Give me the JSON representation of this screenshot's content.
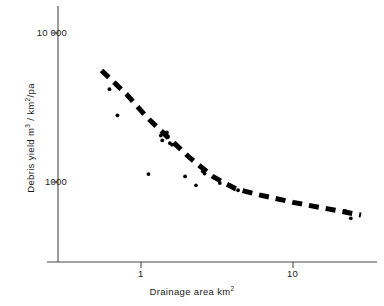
{
  "chart_data": {
    "type": "scatter",
    "title": "",
    "xlabel": "Drainage area  km2",
    "xlabel_main": "Drainage area  km",
    "xlabel_sup": "2",
    "ylabel": "Debris yield m3 / km2/pa",
    "ylabel_part1": "Debris yield  m",
    "ylabel_sup1": "3",
    "ylabel_part2": " / km",
    "ylabel_sup2": "2",
    "ylabel_part3": "/pa",
    "xscale": "log",
    "yscale": "log",
    "xlim": [
      0.35,
      35
    ],
    "ylim": [
      400,
      13000
    ],
    "xticks": [
      1,
      10
    ],
    "xtick_labels": [
      "1",
      "10"
    ],
    "yticks": [
      1000,
      10000
    ],
    "ytick_labels": [
      "1000",
      "10 000"
    ],
    "grid": false,
    "legend": "none",
    "marker_color": "#000000",
    "line_color": "#000000",
    "axis_color": "#444444",
    "background": "#ffffff",
    "points": [
      {
        "x": 0.62,
        "y": 4200
      },
      {
        "x": 0.68,
        "y": 4600
      },
      {
        "x": 0.69,
        "y": 4500
      },
      {
        "x": 0.7,
        "y": 2800
      },
      {
        "x": 1.12,
        "y": 1130
      },
      {
        "x": 1.35,
        "y": 2050
      },
      {
        "x": 1.38,
        "y": 1900
      },
      {
        "x": 1.48,
        "y": 2150
      },
      {
        "x": 1.5,
        "y": 2000
      },
      {
        "x": 1.55,
        "y": 1820
      },
      {
        "x": 1.6,
        "y": 1780
      },
      {
        "x": 1.95,
        "y": 1090
      },
      {
        "x": 2.3,
        "y": 950
      },
      {
        "x": 2.55,
        "y": 1180
      },
      {
        "x": 2.62,
        "y": 1140
      },
      {
        "x": 3.3,
        "y": 985
      },
      {
        "x": 4.35,
        "y": 880
      },
      {
        "x": 22.0,
        "y": 640
      },
      {
        "x": 24.0,
        "y": 570
      }
    ],
    "trend_line": {
      "style": "dashed",
      "width_px": 5,
      "dash_pattern": "10 7",
      "vertices": [
        {
          "x": 0.55,
          "y": 5600
        },
        {
          "x": 0.8,
          "y": 3900
        },
        {
          "x": 1.1,
          "y": 2700
        },
        {
          "x": 1.5,
          "y": 2000
        },
        {
          "x": 2.1,
          "y": 1450
        },
        {
          "x": 3.0,
          "y": 1080
        },
        {
          "x": 4.2,
          "y": 900
        },
        {
          "x": 6.0,
          "y": 820
        },
        {
          "x": 10.0,
          "y": 730
        },
        {
          "x": 17.0,
          "y": 660
        },
        {
          "x": 28.0,
          "y": 600
        }
      ]
    },
    "axes_geometry": {
      "origin_px": {
        "x": 58,
        "y": 262
      },
      "x_tick1_px": 141,
      "x_tick10_px": 293,
      "y_tick10000_px": 33,
      "y_tick1000_px": 182,
      "x_axis_right_px": 377,
      "y_axis_top_px": 6
    }
  },
  "alt_text": "Log-log scatter plot of debris yield versus drainage area with a heavy dashed decreasing trend line"
}
